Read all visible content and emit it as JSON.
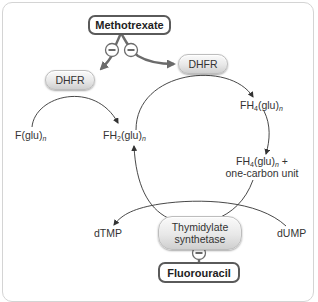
{
  "diagram": {
    "inhibitors": {
      "methotrexate": "Methotrexate",
      "fluorouracil": "Fluorouracil"
    },
    "enzymes": {
      "dhfr_left": "DHFR",
      "dhfr_right": "DHFR",
      "thymidylate_synthetase_line1": "Thymidylate",
      "thymidylate_synthetase_line2": "synthetase"
    },
    "metabolites": {
      "folate": {
        "base": "F(glu)",
        "sub": "n"
      },
      "dihydrofolate": {
        "prefix": "FH",
        "num": "2",
        "base": "(glu)",
        "sub": "n"
      },
      "tetrahydrofolate": {
        "prefix": "FH",
        "num": "4",
        "base": "(glu)",
        "sub": "n"
      },
      "tetrahydrofolate_one_carbon": {
        "prefix": "FH",
        "num": "4",
        "base": "(glu)",
        "sub": "n",
        "suffix": " +",
        "line2": "one-carbon unit"
      },
      "dtmp": "dTMP",
      "dump": "dUMP"
    },
    "inhibition_symbol": "minus-circle",
    "colors": {
      "drug_border": "#5a5a5a",
      "inhibition_arrow": "#6b6b6b",
      "pathway_line": "#333333",
      "frame": "#d4d4d4"
    }
  }
}
